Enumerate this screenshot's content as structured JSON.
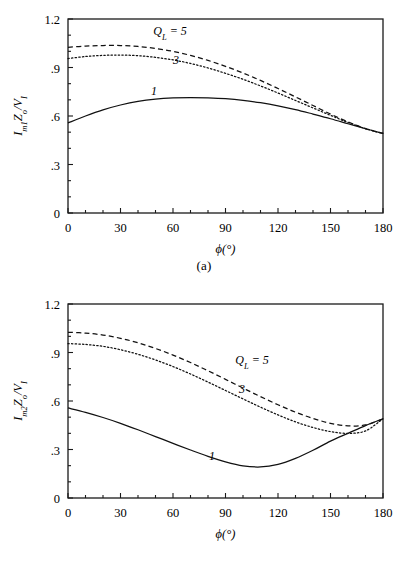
{
  "figure": {
    "panels": [
      {
        "caption": "(a)",
        "ylabel": "Iₘ₁Zₒ/Vᵢ",
        "ylabel_parts": {
          "base1": "I",
          "sub1": "m1",
          "base2": "Z",
          "sub2": "o",
          "slash": "/",
          "base3": "V",
          "sub3": "I"
        },
        "xlabel": "ϕ(°)",
        "legend": [
          {
            "text": "Q",
            "sub": "L",
            "eq": "= 5",
            "full": "Q_L = 5"
          },
          {
            "text": "3",
            "full": "3"
          },
          {
            "text": "1",
            "full": "1"
          }
        ]
      },
      {
        "caption": "(b)",
        "ylabel": "Iₘ₂Zₒ/Vᵢ",
        "ylabel_parts": {
          "base1": "I",
          "sub1": "m2",
          "base2": "Z",
          "sub2": "o",
          "slash": "/",
          "base3": "V",
          "sub3": "I"
        },
        "xlabel": "ϕ(°)",
        "legend": [
          {
            "text": "Q",
            "sub": "L",
            "eq": "= 5",
            "full": "Q_L = 5"
          },
          {
            "text": "3",
            "full": "3"
          },
          {
            "text": "1",
            "full": "1"
          }
        ]
      }
    ]
  },
  "chart_data": [
    {
      "type": "line",
      "title": "",
      "panel": "(a)",
      "xlabel": "ϕ(°)",
      "ylabel": "Im1*Zo/VI",
      "xlim": [
        0,
        180
      ],
      "ylim": [
        0,
        1.2
      ],
      "xticks": [
        0,
        30,
        60,
        90,
        120,
        150,
        180
      ],
      "xticklabels": [
        "0",
        "30",
        "60",
        "90",
        "120",
        "150",
        "180"
      ],
      "yticks": [
        0,
        0.3,
        0.6,
        0.9,
        1.2
      ],
      "yticklabels": [
        "0",
        ".3",
        ".6",
        ".9",
        "1.2"
      ],
      "grid": false,
      "legend_position": "inside-upper-center",
      "series": [
        {
          "name": "Q_L = 5",
          "style": "dashed",
          "x": [
            0,
            10,
            20,
            30,
            40,
            50,
            60,
            70,
            80,
            90,
            100,
            110,
            120,
            130,
            140,
            150,
            160,
            170,
            180
          ],
          "y": [
            1.025,
            1.032,
            1.036,
            1.036,
            1.03,
            1.018,
            1.0,
            0.975,
            0.944,
            0.907,
            0.866,
            0.82,
            0.77,
            0.718,
            0.665,
            0.612,
            0.564,
            0.522,
            0.492
          ]
        },
        {
          "name": "3",
          "style": "dotted",
          "x": [
            0,
            10,
            20,
            30,
            40,
            50,
            60,
            70,
            80,
            90,
            100,
            110,
            120,
            130,
            140,
            150,
            160,
            170,
            180
          ],
          "y": [
            0.955,
            0.968,
            0.975,
            0.977,
            0.973,
            0.963,
            0.947,
            0.925,
            0.897,
            0.864,
            0.827,
            0.786,
            0.742,
            0.696,
            0.65,
            0.604,
            0.56,
            0.522,
            0.492
          ]
        },
        {
          "name": "1",
          "style": "solid",
          "x": [
            0,
            10,
            20,
            30,
            40,
            50,
            60,
            70,
            80,
            90,
            100,
            110,
            120,
            130,
            140,
            150,
            160,
            170,
            180
          ],
          "y": [
            0.557,
            0.6,
            0.638,
            0.668,
            0.691,
            0.705,
            0.712,
            0.714,
            0.712,
            0.707,
            0.697,
            0.682,
            0.663,
            0.64,
            0.612,
            0.583,
            0.552,
            0.521,
            0.492
          ]
        }
      ]
    },
    {
      "type": "line",
      "title": "",
      "panel": "(b)",
      "xlabel": "ϕ(°)",
      "ylabel": "Im2*Zo/VI",
      "xlim": [
        0,
        180
      ],
      "ylim": [
        0,
        1.2
      ],
      "xticks": [
        0,
        30,
        60,
        90,
        120,
        150,
        180
      ],
      "xticklabels": [
        "0",
        "30",
        "60",
        "90",
        "120",
        "150",
        "180"
      ],
      "yticks": [
        0,
        0.3,
        0.6,
        0.9,
        1.2
      ],
      "yticklabels": [
        "0",
        ".3",
        ".6",
        ".9",
        "1.2"
      ],
      "grid": false,
      "legend_position": "inside-center-right",
      "series": [
        {
          "name": "Q_L = 5",
          "style": "dashed",
          "x": [
            0,
            10,
            20,
            30,
            40,
            50,
            60,
            70,
            80,
            90,
            100,
            110,
            120,
            130,
            140,
            150,
            160,
            170,
            180
          ],
          "y": [
            1.025,
            1.02,
            1.008,
            0.988,
            0.96,
            0.925,
            0.884,
            0.838,
            0.787,
            0.734,
            0.68,
            0.627,
            0.577,
            0.531,
            0.492,
            0.462,
            0.446,
            0.452,
            0.49
          ]
        },
        {
          "name": "3",
          "style": "dotted",
          "x": [
            0,
            10,
            20,
            30,
            40,
            50,
            60,
            70,
            80,
            90,
            100,
            110,
            120,
            130,
            140,
            150,
            160,
            170,
            180
          ],
          "y": [
            0.955,
            0.95,
            0.938,
            0.917,
            0.889,
            0.854,
            0.813,
            0.767,
            0.717,
            0.665,
            0.613,
            0.562,
            0.514,
            0.471,
            0.436,
            0.411,
            0.4,
            0.415,
            0.49
          ]
        },
        {
          "name": "1",
          "style": "solid",
          "x": [
            0,
            10,
            20,
            30,
            40,
            50,
            60,
            70,
            80,
            90,
            100,
            110,
            120,
            130,
            140,
            150,
            160,
            170,
            180
          ],
          "y": [
            0.557,
            0.53,
            0.498,
            0.462,
            0.422,
            0.38,
            0.338,
            0.297,
            0.258,
            0.224,
            0.199,
            0.192,
            0.208,
            0.245,
            0.295,
            0.352,
            0.4,
            0.448,
            0.49
          ]
        }
      ]
    }
  ]
}
